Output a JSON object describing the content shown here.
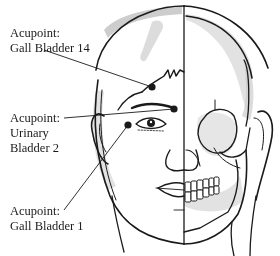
{
  "diagram": {
    "colors": {
      "ink": "#1a1a1a",
      "shade": "#b8b8b8",
      "light_shade": "#d6d6d6",
      "background": "#ffffff"
    },
    "labels": [
      {
        "id": "gb14",
        "line1": "Acupoint:",
        "line2": "Gall Bladder 14"
      },
      {
        "id": "ub2",
        "line1": "Acupoint:",
        "line2": "Urinary",
        "line3": "Bladder 2"
      },
      {
        "id": "gb1",
        "line1": "Acupoint:",
        "line2": "Gall Bladder 1"
      }
    ],
    "points": [
      {
        "id": "gb14",
        "x": 152,
        "y": 87
      },
      {
        "id": "ub2",
        "x": 174,
        "y": 109
      },
      {
        "id": "gb1",
        "x": 128,
        "y": 125
      }
    ]
  }
}
